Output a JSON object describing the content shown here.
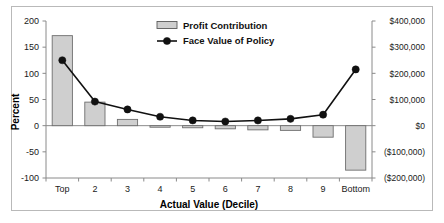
{
  "chart_data": {
    "type": "bar",
    "title": "",
    "xlabel": "Actual Value (Decile)",
    "ylabel": "Percent",
    "categories": [
      "Top",
      "2",
      "3",
      "4",
      "5",
      "6",
      "7",
      "8",
      "9",
      "Bottom"
    ],
    "left_axis": {
      "label": "Percent",
      "ticks": [
        "200",
        "150",
        "100",
        "50",
        "0",
        "-50",
        "-100"
      ],
      "tick_values": [
        200,
        150,
        100,
        50,
        0,
        -50,
        -100
      ],
      "ylim": [
        -100,
        200
      ]
    },
    "right_axis": {
      "label": "",
      "ticks": [
        "$400,000",
        "$300,000",
        "$200,000",
        "$100,000",
        "$0",
        "($100,000)",
        "($200,000)"
      ],
      "tick_values": [
        400000,
        300000,
        200000,
        100000,
        0,
        -100000,
        -200000
      ],
      "ylim": [
        -200000,
        400000
      ]
    },
    "grid": false,
    "legend_position": "top-center",
    "series": [
      {
        "name": "Profit Contribution",
        "type": "bar",
        "axis": "left",
        "unit": "percent",
        "values": [
          172,
          45,
          12,
          -3,
          -4,
          -6,
          -8,
          -9,
          -22,
          -85
        ]
      },
      {
        "name": "Face Value of Policy",
        "type": "line",
        "axis": "right",
        "unit": "dollars",
        "values": [
          250000,
          92000,
          62000,
          34000,
          20000,
          16000,
          20000,
          26000,
          42000,
          215000
        ]
      }
    ]
  },
  "legend": {
    "items": [
      {
        "label": "Profit Contribution",
        "marker": "bar-swatch",
        "color": "#cfcfcf"
      },
      {
        "label": "Face Value of Policy",
        "marker": "line-point",
        "color": "#111111"
      }
    ]
  },
  "colors": {
    "bar_fill": "#cfcfcf",
    "bar_stroke": "#6e6e6e",
    "line": "#111111",
    "axis": "#8a8a8a",
    "frame": "#b9b9b9",
    "text": "#1a1a1a",
    "background": "#ffffff"
  }
}
